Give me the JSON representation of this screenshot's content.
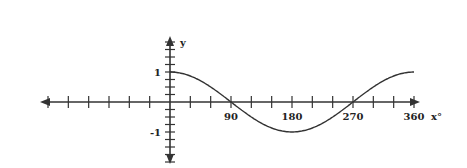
{
  "chart_data": {
    "type": "line",
    "title": "",
    "xlabel": "x°",
    "ylabel": "y",
    "function": "y = cos(x)",
    "x_tick_labels": [
      "90",
      "180",
      "270",
      "360"
    ],
    "y_tick_labels": [
      "1",
      "-1"
    ],
    "x": [
      0,
      30,
      60,
      90,
      120,
      150,
      180,
      210,
      240,
      270,
      300,
      330,
      360
    ],
    "series": [
      {
        "name": "cos x",
        "values": [
          1,
          0.87,
          0.5,
          0,
          -0.5,
          -0.87,
          -1,
          -0.87,
          -0.5,
          0,
          0.5,
          0.87,
          1
        ]
      }
    ],
    "xlim": [
      -180,
      360
    ],
    "ylim": [
      -2,
      2
    ],
    "x_tick_step": 30,
    "y_tick_step": 0.25,
    "grid": false,
    "legend": "none",
    "colors": {
      "axis": "#333333",
      "curve": "#333333"
    }
  }
}
